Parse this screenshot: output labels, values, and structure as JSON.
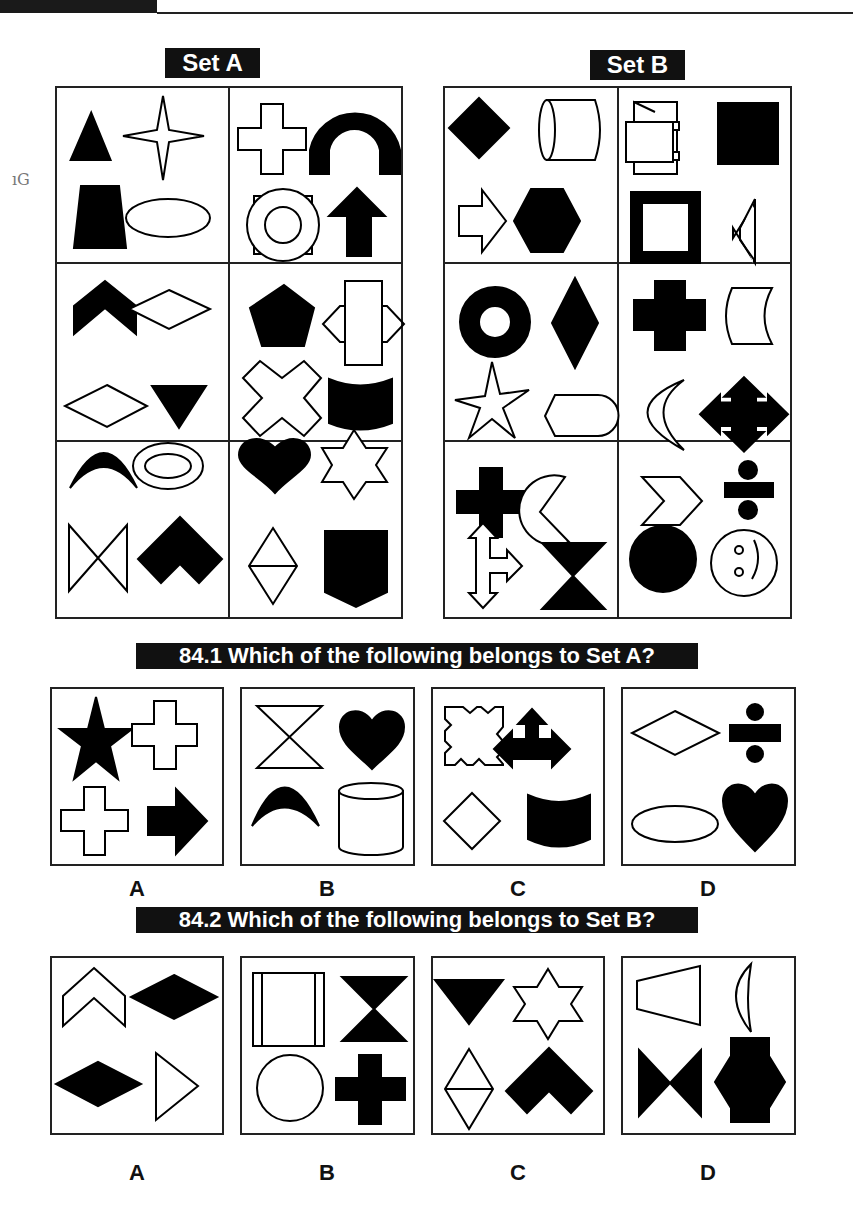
{
  "header": {
    "bar": true
  },
  "margin_note": "ıG",
  "sets": [
    {
      "label": "Set A",
      "cells": [
        [
          "filled-triangle",
          "outline-four-point-star",
          "filled-trapezoid",
          "outline-ellipse"
        ],
        [
          "outline-cross",
          "filled-arch",
          "outline-ring-in-square",
          "filled-up-arrow"
        ],
        [
          "filled-chevron",
          "outline-rhombus",
          "outline-rhombus",
          "filled-down-triangle"
        ],
        [
          "filled-pentagon",
          "outline-rect-with-side-points",
          "outline-x-cross",
          "filled-cylinder-curved"
        ],
        [
          "filled-crescent-arc",
          "outline-double-ellipse",
          "outline-bowtie",
          "filled-chevron-thick"
        ],
        [
          "filled-heart",
          "outline-six-point-star",
          "outline-split-rhombus",
          "filled-shield"
        ]
      ]
    },
    {
      "label": "Set B",
      "cells": [
        [
          "filled-diamond",
          "outline-cylinder-horizontal",
          "outline-scroll",
          "filled-square"
        ],
        [
          "outline-right-arrow",
          "filled-hexagon",
          "thick-square-frame",
          "outline-side-trapezoid"
        ],
        [
          "filled-ring",
          "filled-tall-rhombus",
          "filled-stepped-cross",
          "outline-concave-rect"
        ],
        [
          "outline-five-point-star",
          "outline-tab-shape",
          "outline-crescent-moon",
          "filled-four-way-arrow"
        ],
        [
          "filled-plus",
          "outline-pacman",
          "outline-three-way-arrow",
          "filled-hourglass"
        ],
        [
          "outline-chevron-right",
          "filled-divide-sign",
          "filled-circle",
          "outline-smiley"
        ]
      ]
    }
  ],
  "questions": [
    {
      "label": "84.1 Which of the following belongs to Set A?",
      "options": [
        {
          "letter": "A",
          "shapes": [
            "filled-five-point-star",
            "outline-cross",
            "outline-cross",
            "filled-right-arrow"
          ]
        },
        {
          "letter": "B",
          "shapes": [
            "outline-hourglass",
            "filled-heart",
            "filled-crescent-arc",
            "outline-cylinder"
          ]
        },
        {
          "letter": "C",
          "shapes": [
            "outline-notched-square",
            "filled-three-way-arrow",
            "outline-diamond",
            "filled-cylinder-curved"
          ]
        },
        {
          "letter": "D",
          "shapes": [
            "outline-rhombus",
            "filled-divide-sign",
            "outline-ellipse",
            "filled-heart"
          ]
        }
      ]
    },
    {
      "label": "84.2 Which of the following belongs to Set B?",
      "options": [
        {
          "letter": "A",
          "shapes": [
            "outline-chevron",
            "filled-rhombus",
            "filled-rhombus",
            "outline-right-triangle"
          ]
        },
        {
          "letter": "B",
          "shapes": [
            "outline-barred-square",
            "filled-hourglass",
            "outline-circle",
            "filled-plus"
          ]
        },
        {
          "letter": "C",
          "shapes": [
            "filled-down-triangle",
            "outline-six-point-star",
            "outline-split-rhombus",
            "filled-chevron-thick"
          ]
        },
        {
          "letter": "D",
          "shapes": [
            "outline-trapezoid",
            "outline-half-moon",
            "filled-bowtie",
            "filled-octo-cross"
          ]
        }
      ]
    }
  ]
}
